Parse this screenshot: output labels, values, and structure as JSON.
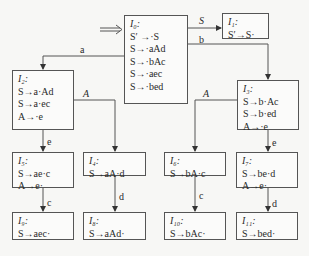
{
  "diagram": {
    "type": "LR(0) item-set automaton",
    "start_arrow": "⟹",
    "states": [
      {
        "id": "I0",
        "title": "I₀:",
        "items": [
          "S′ →·S",
          "S→·aAd",
          "S→·bAc",
          "S→·aec",
          "S→·bed"
        ]
      },
      {
        "id": "I1",
        "title": "I₁:",
        "items": [
          "S′→S·"
        ]
      },
      {
        "id": "I2",
        "title": "I₂:",
        "items": [
          "S→a·Ad",
          "S→a·ec",
          "A→·e"
        ]
      },
      {
        "id": "I3",
        "title": "I₃:",
        "items": [
          "S→b·Ac",
          "S→b·ed",
          "A→·e"
        ]
      },
      {
        "id": "I4",
        "title": "I₄:",
        "items": [
          "S→aA·d"
        ]
      },
      {
        "id": "I5",
        "title": "I₅:",
        "items": [
          "S→ae·c",
          "A→e·"
        ]
      },
      {
        "id": "I6",
        "title": "I₆:",
        "items": [
          "S→bA·c"
        ]
      },
      {
        "id": "I7",
        "title": "I₇:",
        "items": [
          "S→be·d",
          "A→e·"
        ]
      },
      {
        "id": "I8",
        "title": "I₈:",
        "items": [
          "S→aAd·"
        ]
      },
      {
        "id": "I9",
        "title": "I₉:",
        "items": [
          "S→aec·"
        ]
      },
      {
        "id": "I10",
        "title": "I₁₀:",
        "items": [
          "S→bAc·"
        ]
      },
      {
        "id": "I11",
        "title": "I₁₁:",
        "items": [
          "S→bed·"
        ]
      }
    ],
    "transitions": [
      {
        "from": "I0",
        "to": "I1",
        "label": "S"
      },
      {
        "from": "I0",
        "to": "I2",
        "label": "a"
      },
      {
        "from": "I0",
        "to": "I3",
        "label": "b"
      },
      {
        "from": "I2",
        "to": "I4",
        "label": "A"
      },
      {
        "from": "I2",
        "to": "I5",
        "label": "e"
      },
      {
        "from": "I3",
        "to": "I6",
        "label": "A"
      },
      {
        "from": "I3",
        "to": "I7",
        "label": "e"
      },
      {
        "from": "I4",
        "to": "I8",
        "label": "d"
      },
      {
        "from": "I5",
        "to": "I9",
        "label": "c"
      },
      {
        "from": "I6",
        "to": "I10",
        "label": "c"
      },
      {
        "from": "I7",
        "to": "I11",
        "label": "d"
      }
    ]
  }
}
